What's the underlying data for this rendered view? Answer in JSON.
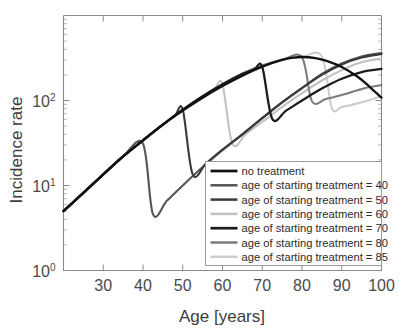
{
  "chart_data": {
    "type": "line",
    "title": "",
    "xlabel": "Age [years]",
    "ylabel": "Incidence rate",
    "xlim": [
      20,
      100
    ],
    "ylim": [
      1,
      1000
    ],
    "yscale": "log",
    "grid": false,
    "legend_position": "lower-right",
    "xticks": [
      30,
      40,
      50,
      60,
      70,
      80,
      90,
      100
    ],
    "xticklabels": [
      "30",
      "40",
      "50",
      "60",
      "70",
      "80",
      "90",
      "100"
    ],
    "yticks": [
      1,
      10,
      100
    ],
    "yticklabels": [
      "10^0",
      "10^1",
      "10^2"
    ],
    "ytick_base": "10",
    "ytick_exponents": [
      "0",
      "1",
      "2"
    ],
    "series": [
      {
        "name": "no treatment",
        "label": "no treatment",
        "color": "#111111",
        "width": 2.3,
        "treatment_start": null,
        "points": [
          [
            20,
            5.0
          ],
          [
            25,
            8.2
          ],
          [
            30,
            13.5
          ],
          [
            35,
            22.0
          ],
          [
            40,
            34.0
          ],
          [
            45,
            52.0
          ],
          [
            50,
            76.0
          ],
          [
            55,
            108.0
          ],
          [
            60,
            148.0
          ],
          [
            65,
            196.0
          ],
          [
            70,
            250.0
          ],
          [
            75,
            300.0
          ],
          [
            78,
            320.0
          ],
          [
            80,
            325.0
          ],
          [
            83,
            318.0
          ],
          [
            86,
            295.0
          ],
          [
            90,
            248.0
          ],
          [
            94,
            190.0
          ],
          [
            97,
            145.0
          ],
          [
            100,
            108.0
          ]
        ]
      },
      {
        "name": "treatment_40",
        "label": "age of starting treatment = 40",
        "color": "#555555",
        "width": 2.1,
        "treatment_start": 40,
        "points": [
          [
            20,
            5.0
          ],
          [
            25,
            8.2
          ],
          [
            30,
            13.5
          ],
          [
            35,
            22.0
          ],
          [
            40,
            31.0
          ],
          [
            42.5,
            4.6
          ],
          [
            46,
            6.6
          ],
          [
            50,
            10.0
          ],
          [
            55,
            16.5
          ],
          [
            60,
            26.0
          ],
          [
            65,
            40.0
          ],
          [
            70,
            62.0
          ],
          [
            75,
            95.0
          ],
          [
            80,
            140.0
          ],
          [
            85,
            205.0
          ],
          [
            90,
            272.0
          ],
          [
            95,
            330.0
          ],
          [
            100,
            362.0
          ]
        ]
      },
      {
        "name": "treatment_50",
        "label": "age of starting treatment = 50",
        "color": "#3a3a3a",
        "width": 2.1,
        "treatment_start": 50,
        "points": [
          [
            20,
            5.0
          ],
          [
            25,
            8.2
          ],
          [
            30,
            13.5
          ],
          [
            35,
            22.0
          ],
          [
            40,
            34.0
          ],
          [
            45,
            52.0
          ],
          [
            48,
            66.0
          ],
          [
            50,
            78.0
          ],
          [
            52.5,
            13.5
          ],
          [
            56,
            18.5
          ],
          [
            60,
            26.5
          ],
          [
            65,
            40.0
          ],
          [
            70,
            62.0
          ],
          [
            75,
            95.0
          ],
          [
            80,
            140.0
          ],
          [
            85,
            200.0
          ],
          [
            90,
            265.0
          ],
          [
            95,
            320.0
          ],
          [
            100,
            352.0
          ]
        ]
      },
      {
        "name": "treatment_60",
        "label": "age of starting treatment = 60",
        "color": "#c2c2c2",
        "width": 2.1,
        "treatment_start": 60,
        "points": [
          [
            20,
            5.0
          ],
          [
            25,
            8.2
          ],
          [
            30,
            13.5
          ],
          [
            35,
            22.0
          ],
          [
            40,
            34.0
          ],
          [
            45,
            52.0
          ],
          [
            50,
            78.0
          ],
          [
            55,
            112.0
          ],
          [
            58,
            138.0
          ],
          [
            60,
            155.0
          ],
          [
            62.5,
            31.0
          ],
          [
            66,
            41.0
          ],
          [
            70,
            56.0
          ],
          [
            75,
            84.0
          ],
          [
            80,
            122.0
          ],
          [
            85,
            172.0
          ],
          [
            90,
            228.0
          ],
          [
            95,
            282.0
          ],
          [
            100,
            312.0
          ]
        ]
      },
      {
        "name": "treatment_70",
        "label": "age of starting treatment = 70",
        "color": "#1c1c1c",
        "width": 2.3,
        "treatment_start": 70,
        "points": [
          [
            20,
            5.0
          ],
          [
            25,
            8.2
          ],
          [
            30,
            13.5
          ],
          [
            35,
            22.0
          ],
          [
            40,
            34.0
          ],
          [
            45,
            52.0
          ],
          [
            50,
            78.0
          ],
          [
            55,
            112.0
          ],
          [
            60,
            155.0
          ],
          [
            65,
            205.0
          ],
          [
            68,
            232.0
          ],
          [
            70,
            248.0
          ],
          [
            72.5,
            61.0
          ],
          [
            76,
            76.0
          ],
          [
            80,
            100.0
          ],
          [
            85,
            138.0
          ],
          [
            90,
            180.0
          ],
          [
            95,
            216.0
          ],
          [
            100,
            235.0
          ]
        ]
      },
      {
        "name": "treatment_80",
        "label": "age of starting treatment = 80",
        "color": "#7d7d7d",
        "width": 2.1,
        "treatment_start": 80,
        "points": [
          [
            20,
            5.0
          ],
          [
            25,
            8.2
          ],
          [
            30,
            13.5
          ],
          [
            35,
            22.0
          ],
          [
            40,
            34.0
          ],
          [
            45,
            52.0
          ],
          [
            50,
            78.0
          ],
          [
            55,
            112.0
          ],
          [
            60,
            155.0
          ],
          [
            65,
            208.0
          ],
          [
            70,
            258.0
          ],
          [
            75,
            300.0
          ],
          [
            80,
            322.0
          ],
          [
            82.5,
            98.0
          ],
          [
            86,
            104.0
          ],
          [
            90,
            116.0
          ],
          [
            94,
            132.0
          ],
          [
            97,
            144.0
          ],
          [
            100,
            152.0
          ]
        ]
      },
      {
        "name": "treatment_85",
        "label": "age of starting treatment = 85",
        "color": "#cdcdcd",
        "width": 2.1,
        "treatment_start": 85,
        "points": [
          [
            20,
            5.0
          ],
          [
            25,
            8.2
          ],
          [
            30,
            13.5
          ],
          [
            35,
            22.0
          ],
          [
            40,
            34.0
          ],
          [
            45,
            52.0
          ],
          [
            50,
            78.0
          ],
          [
            55,
            112.0
          ],
          [
            60,
            155.0
          ],
          [
            65,
            208.0
          ],
          [
            70,
            260.0
          ],
          [
            75,
            305.0
          ],
          [
            80,
            328.0
          ],
          [
            85,
            330.0
          ],
          [
            87.5,
            82.0
          ],
          [
            90,
            84.0
          ],
          [
            93,
            90.0
          ],
          [
            96,
            98.0
          ],
          [
            100,
            112.0
          ]
        ]
      }
    ]
  },
  "legend": {
    "entries": [
      "no treatment",
      "age of starting treatment = 40",
      "age of starting treatment = 50",
      "age of starting treatment = 60",
      "age of starting treatment = 70",
      "age of starting treatment = 80",
      "age of starting treatment = 85"
    ]
  }
}
